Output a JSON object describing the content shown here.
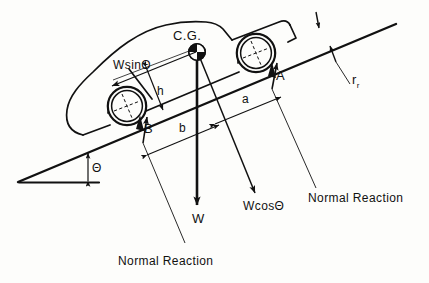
{
  "figure": {
    "kind": "free-body-diagram",
    "background_color": "#fdfdfb",
    "ink_color": "#111111"
  },
  "labels": {
    "cg": "C.G.",
    "wsin": "WsinΘ",
    "wcos": "WcosΘ",
    "w": "W",
    "theta": "Θ",
    "point_a": "A",
    "point_b": "B",
    "dim_h": "h",
    "dim_a": "a",
    "dim_b": "b",
    "rolling_radius": "r",
    "rolling_radius_sub": "r",
    "normal_reaction_front": "Normal Reaction",
    "normal_reaction_rear": "Normal Reaction"
  },
  "icons": {
    "cg_marker": "center-of-gravity-icon",
    "wheel_front": "wheel-icon",
    "wheel_rear": "wheel-icon",
    "car_body": "car-silhouette-icon"
  },
  "geometry": {
    "incline_angle_deg": 17,
    "slope_line": {
      "x1": 18,
      "y1": 182,
      "x2": 392,
      "y2": 25
    },
    "ground_line": {
      "x1": 18,
      "y1": 182,
      "x2": 98,
      "y2": 182
    },
    "cg_point": {
      "x": 197,
      "y": 52
    },
    "wheel_front_center": {
      "x": 256,
      "y": 53
    },
    "wheel_rear_center": {
      "x": 127,
      "y": 106
    },
    "wheel_radius": 19
  }
}
